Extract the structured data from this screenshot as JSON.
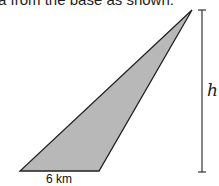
{
  "caption": "a from the base as shown:",
  "diagram": {
    "base_label": "6 km",
    "height_label": "h",
    "fill_color": "#b8b8b8",
    "stroke_color": "#222222"
  }
}
